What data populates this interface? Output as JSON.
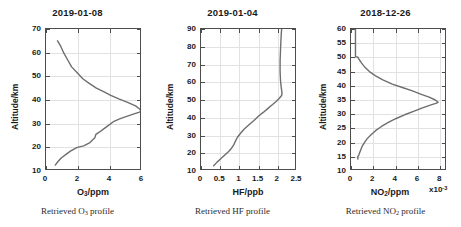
{
  "figure": {
    "background": "#ffffff",
    "curve_color": "#6e6e6e",
    "axis_color": "#4d4d4d",
    "grid_color": "#e2e2e2"
  },
  "panels": [
    {
      "id": "ozone",
      "title": "2019-01-08",
      "caption_prefix": "Retrieved O",
      "caption_sub": "3",
      "caption_suffix": " profile",
      "ylabel": "Altitude/km",
      "xlabel_prefix": "O",
      "xlabel_sub": "3",
      "xlabel_suffix": "/ppm",
      "exponent": "",
      "yticks": [
        "10",
        "20",
        "30",
        "40",
        "50",
        "60",
        "70"
      ],
      "xticks": [
        "0",
        "2",
        "4",
        "6"
      ]
    },
    {
      "id": "hf",
      "title": "2019-01-04",
      "caption_prefix": "Retrieved HF",
      "caption_sub": "",
      "caption_suffix": " profile",
      "ylabel": "Altitude/km",
      "xlabel_prefix": "HF",
      "xlabel_sub": "",
      "xlabel_suffix": "/ppb",
      "exponent": "",
      "yticks": [
        "10",
        "20",
        "30",
        "40",
        "50",
        "60",
        "70",
        "80",
        "90"
      ],
      "xticks": [
        "0",
        "0.5",
        "1",
        "1.5",
        "2",
        "2.5"
      ]
    },
    {
      "id": "no2",
      "title": "2018-12-26",
      "caption_prefix": "Retrieved NO",
      "caption_sub": "2",
      "caption_suffix": " profile",
      "ylabel": "Altitude/km",
      "xlabel_prefix": "NO",
      "xlabel_sub": "2",
      "xlabel_suffix": "/ppm",
      "exponent_base": "x10",
      "exponent_sup": "-3",
      "yticks": [
        "10",
        "15",
        "20",
        "25",
        "30",
        "35",
        "40",
        "45",
        "50",
        "55",
        "60"
      ],
      "xticks": [
        "0",
        "2",
        "4",
        "6",
        "8"
      ]
    }
  ],
  "chart_data": [
    {
      "type": "line",
      "id": "ozone",
      "title": "2019-01-08",
      "xlabel": "O3/ppm",
      "ylabel": "Altitude/km",
      "xlim": [
        0,
        6
      ],
      "ylim": [
        10,
        70
      ],
      "xticks": [
        0,
        2,
        4,
        6
      ],
      "yticks": [
        10,
        20,
        30,
        40,
        50,
        60,
        70
      ],
      "grid": true,
      "legend": "none",
      "caption": "Retrieved O3 profile",
      "series": [
        {
          "name": "O3 profile",
          "x": [
            0.58,
            0.75,
            0.95,
            1.25,
            1.55,
            1.95,
            2.35,
            2.75,
            3.05,
            3.12,
            3.35,
            3.65,
            3.95,
            4.25,
            4.6,
            5.0,
            5.45,
            5.8,
            5.95,
            5.85,
            5.6,
            5.1,
            4.55,
            4.05,
            3.6,
            3.15,
            2.7,
            2.3,
            1.95,
            1.6,
            1.35,
            1.1,
            0.9,
            0.72
          ],
          "y": [
            12.5,
            14.0,
            15.5,
            17.0,
            18.5,
            20.0,
            20.6,
            22.0,
            24.0,
            25.5,
            26.5,
            28.0,
            29.5,
            31.0,
            32.0,
            33.0,
            34.0,
            34.8,
            35.3,
            36.2,
            37.5,
            39.0,
            40.5,
            42.0,
            43.5,
            45.0,
            47.0,
            49.0,
            51.5,
            54.0,
            57.0,
            60.0,
            63.0,
            65.0
          ]
        }
      ]
    },
    {
      "type": "line",
      "id": "hf",
      "title": "2019-01-04",
      "xlabel": "HF/ppb",
      "ylabel": "Altitude/km",
      "xlim": [
        0,
        2.5
      ],
      "ylim": [
        10,
        90
      ],
      "xticks": [
        0,
        0.5,
        1,
        1.5,
        2,
        2.5
      ],
      "yticks": [
        10,
        20,
        30,
        40,
        50,
        60,
        70,
        80,
        90
      ],
      "grid": true,
      "legend": "none",
      "caption": "Retrieved HF profile",
      "series": [
        {
          "name": "HF profile",
          "x": [
            0.33,
            0.42,
            0.52,
            0.62,
            0.72,
            0.8,
            0.86,
            0.9,
            0.95,
            1.02,
            1.12,
            1.25,
            1.38,
            1.5,
            1.62,
            1.73,
            1.84,
            1.95,
            2.04,
            2.1,
            2.11,
            2.09,
            2.07,
            2.06,
            2.06,
            2.07,
            2.08,
            2.09,
            2.1
          ],
          "y": [
            13.0,
            15.0,
            17.0,
            19.0,
            21.0,
            23.0,
            25.0,
            27.0,
            29.0,
            31.0,
            33.5,
            36.0,
            38.5,
            41.0,
            43.0,
            45.0,
            47.0,
            49.0,
            51.0,
            52.5,
            54.0,
            57.0,
            61.0,
            66.0,
            72.0,
            78.0,
            83.0,
            87.0,
            90.0
          ]
        }
      ]
    },
    {
      "type": "line",
      "id": "no2",
      "title": "2018-12-26",
      "xlabel": "NO2/ppm",
      "ylabel": "Altitude/km",
      "x_exponent": "x10-3",
      "xlim": [
        0,
        8.6
      ],
      "ylim": [
        10,
        60
      ],
      "xticks": [
        0,
        2,
        4,
        6,
        8
      ],
      "yticks": [
        10,
        15,
        20,
        25,
        30,
        35,
        40,
        45,
        50,
        55,
        60
      ],
      "grid": true,
      "legend": "none",
      "caption": "Retrieved NO2 profile",
      "series": [
        {
          "name": "NO2 profile",
          "x": [
            0.62,
            0.6,
            0.7,
            0.78,
            0.88,
            1.0,
            1.2,
            1.45,
            1.8,
            2.2,
            2.7,
            3.3,
            4.0,
            4.8,
            5.6,
            6.4,
            7.1,
            7.6,
            7.8,
            7.55,
            7.0,
            6.3,
            5.5,
            4.6,
            3.7,
            2.9,
            2.2,
            1.65,
            1.25,
            0.95,
            0.78,
            0.68,
            0.62,
            0.58,
            0.4,
            0.4
          ],
          "y": [
            14.2,
            15.0,
            15.6,
            16.5,
            17.5,
            18.7,
            20.0,
            21.4,
            22.8,
            24.2,
            25.6,
            27.0,
            28.4,
            29.8,
            31.0,
            32.2,
            33.2,
            33.8,
            34.2,
            35.0,
            36.0,
            37.0,
            38.2,
            39.4,
            40.6,
            42.0,
            43.5,
            45.0,
            46.5,
            48.0,
            49.0,
            49.6,
            50.0,
            50.2,
            50.2,
            60.0
          ]
        }
      ]
    }
  ]
}
